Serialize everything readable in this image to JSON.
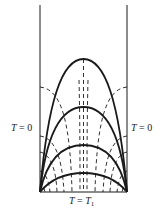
{
  "diagram": {
    "labels": {
      "left_wall": {
        "var": "T",
        "eq": " = ",
        "value": "0"
      },
      "right_wall": {
        "var": "T",
        "eq": " = ",
        "value": "0"
      },
      "bottom": {
        "var": "T",
        "eq": " = ",
        "value": "T",
        "sub": "1"
      }
    },
    "geometry": {
      "left_x": 40,
      "right_x": 127,
      "bottom_y": 192,
      "top_y": 5,
      "isotherm_peaks_y": [
        59,
        107,
        145,
        173
      ],
      "flow_line_wall_y": [
        87,
        136,
        152,
        171,
        182
      ]
    },
    "colors": {
      "stroke": "#1a1a1a",
      "background": "#ffffff"
    }
  }
}
